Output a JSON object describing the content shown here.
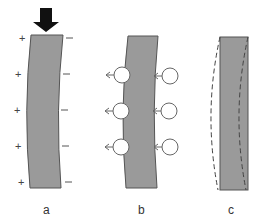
{
  "diagram": {
    "type": "piezoelectric/flexoelectric bending illustration",
    "colors": {
      "plate_fill": "#9a9a9a",
      "plate_stroke": "#555555",
      "arrow": "#111111",
      "circle_fill": "#ffffff",
      "circle_stroke": "#666666",
      "dashed": "#444444"
    },
    "panels": [
      {
        "id": "a",
        "label": "a",
        "force_arrow": "down-arrow-icon",
        "left_signs": [
          "+",
          "+",
          "+",
          "+",
          "+"
        ],
        "right_signs": [
          "—",
          "—",
          "—",
          "—",
          "—"
        ]
      },
      {
        "id": "b",
        "label": "b",
        "left_circles": 3,
        "right_circles": 3,
        "arrow_direction": "left"
      },
      {
        "id": "c",
        "label": "c",
        "outline": "dashed-curved-outline"
      }
    ]
  }
}
